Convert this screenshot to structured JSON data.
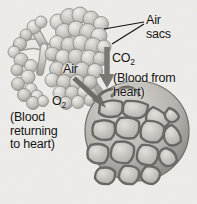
{
  "figure": {
    "background_color": "#f4f3f1",
    "text_color": "#141414",
    "style": "grayscale halftone textbook illustration"
  },
  "labels": {
    "air_sacs": "Air\nsacs",
    "co2_prefix": "CO",
    "co2_subscript": "2",
    "air": "Air",
    "o2_prefix": "O",
    "o2_subscript": "2",
    "blood_from_heart": "(Blood from\nheart)",
    "blood_returning_to_heart": "(Blood\nreturning\nto heart)"
  },
  "artwork": {
    "bronchiole_tree": "branching airway tube at upper left",
    "alveolar_clusters": "grape-like clusters of rounded air sacs",
    "capillary_network": "mesh of polygonal capillary cells wrapping a large alveolar sac at lower right",
    "co2_arrow": "downward arrow indicating carbon dioxide entering the air sac",
    "o2_arrow": "downward-right arrow indicating oxygen entering the blood",
    "leader_lines": "two pointer lines from the Air sacs label to alveoli"
  },
  "colors": {
    "paper": "#f4f3f1",
    "tissue_light": "#dcdad6",
    "tissue_mid": "#b9b6b1",
    "tissue_dark": "#8d8a86",
    "outline": "#5c5a57",
    "capillary_wall": "#7a7774",
    "capillary_lumen": "#cfccc7"
  }
}
